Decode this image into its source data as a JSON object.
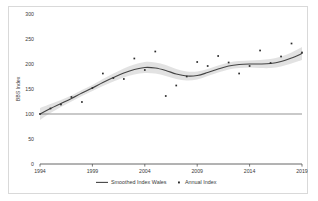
{
  "chart_data": {
    "type": "line",
    "title": "",
    "xlabel": "",
    "ylabel": "BBS Index",
    "xlim": [
      1994,
      2019
    ],
    "ylim": [
      0,
      300
    ],
    "xticks": [
      "1994",
      "1999",
      "2004",
      "2009",
      "2014",
      "2019"
    ],
    "xtick_values": [
      1994,
      1999,
      2004,
      2009,
      2014,
      2019
    ],
    "yticks": [
      "0",
      "50",
      "100",
      "150",
      "200",
      "250",
      "300"
    ],
    "ytick_values": [
      0,
      50,
      100,
      150,
      200,
      250,
      300
    ],
    "grid": false,
    "legend_position": "bottom",
    "reference_line": {
      "y": 100,
      "color": "#666666"
    },
    "series": [
      {
        "name": "Smoothed Index Wales",
        "type": "line",
        "color": "#444444",
        "x": [
          1994,
          1995,
          1996,
          1997,
          1998,
          1999,
          2000,
          2001,
          2002,
          2003,
          2004,
          2005,
          2006,
          2007,
          2008,
          2009,
          2010,
          2011,
          2012,
          2013,
          2014,
          2015,
          2016,
          2017,
          2018,
          2019
        ],
        "values": [
          100,
          111,
          121,
          131,
          142,
          152,
          163,
          173,
          182,
          189,
          193,
          192,
          187,
          180,
          176,
          177,
          183,
          190,
          196,
          199,
          200,
          200,
          201,
          205,
          212,
          221
        ]
      },
      {
        "name": "Confidence band",
        "type": "band",
        "color": "#d0d0d0",
        "x": [
          1994,
          1995,
          1996,
          1997,
          1998,
          1999,
          2000,
          2001,
          2002,
          2003,
          2004,
          2005,
          2006,
          2007,
          2008,
          2009,
          2010,
          2011,
          2012,
          2013,
          2014,
          2015,
          2016,
          2017,
          2018,
          2019
        ],
        "lower": [
          88,
          102,
          114,
          125,
          136,
          146,
          156,
          165,
          173,
          179,
          182,
          181,
          176,
          170,
          167,
          169,
          176,
          183,
          189,
          192,
          193,
          192,
          192,
          195,
          201,
          208
        ],
        "upper": [
          112,
          120,
          128,
          137,
          148,
          158,
          170,
          181,
          191,
          199,
          204,
          203,
          198,
          190,
          185,
          185,
          190,
          197,
          203,
          206,
          207,
          208,
          210,
          215,
          223,
          234
        ]
      },
      {
        "name": "Annual Index",
        "type": "scatter",
        "color": "#2b2b2b",
        "marker": "square",
        "x": [
          1994,
          1995,
          1996,
          1997,
          1998,
          1999,
          2000,
          2001,
          2002,
          2003,
          2004,
          2005,
          2006,
          2007,
          2008,
          2009,
          2010,
          2011,
          2012,
          2013,
          2014,
          2015,
          2016,
          2017,
          2018,
          2019
        ],
        "values": [
          100,
          111,
          119,
          134,
          124,
          152,
          181,
          172,
          170,
          211,
          188,
          225,
          136,
          157,
          175,
          204,
          196,
          216,
          203,
          181,
          196,
          227,
          202,
          215,
          241,
          223
        ]
      }
    ],
    "legend": [
      {
        "label": "Smoothed Index Wales",
        "marker": "line",
        "color": "#444444"
      },
      {
        "label": "Annual Index",
        "marker": "square",
        "color": "#2b2b2b"
      }
    ]
  }
}
